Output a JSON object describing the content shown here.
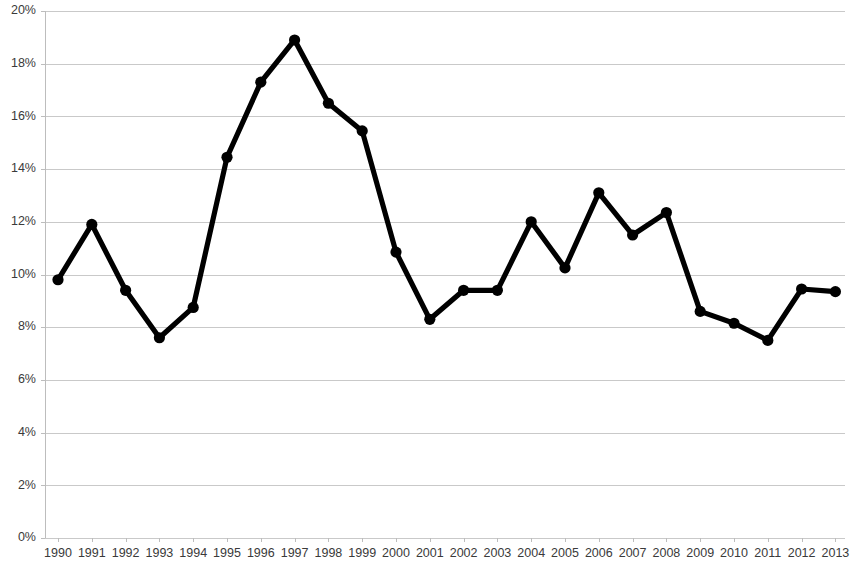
{
  "chart_data": {
    "type": "line",
    "title": "",
    "subtitle": "",
    "xlabel": "",
    "ylabel": "",
    "categories": [
      "1990",
      "1991",
      "1992",
      "1993",
      "1994",
      "1995",
      "1996",
      "1997",
      "1998",
      "1999",
      "2000",
      "2001",
      "2002",
      "2003",
      "2004",
      "2005",
      "2006",
      "2007",
      "2008",
      "2009",
      "2010",
      "2011",
      "2012",
      "2013"
    ],
    "values": [
      9.8,
      11.9,
      9.4,
      7.6,
      8.75,
      14.45,
      17.3,
      18.9,
      16.5,
      15.45,
      10.85,
      8.3,
      9.4,
      9.4,
      12.0,
      10.25,
      13.1,
      11.5,
      12.35,
      8.6,
      8.15,
      7.5,
      9.45,
      9.35
    ],
    "value_unit": "%",
    "series": [
      {
        "name": "",
        "values": [
          9.8,
          11.9,
          9.4,
          7.6,
          8.75,
          14.45,
          17.3,
          18.9,
          16.5,
          15.45,
          10.85,
          8.3,
          9.4,
          9.4,
          12.0,
          10.25,
          13.1,
          11.5,
          12.35,
          8.6,
          8.15,
          7.5,
          9.45,
          9.35
        ],
        "color": "#000000",
        "marker": "circle"
      }
    ],
    "ylim": [
      0,
      20
    ],
    "ytick_values": [
      0,
      2,
      4,
      6,
      8,
      10,
      12,
      14,
      16,
      18,
      20
    ],
    "ytick_labels": [
      "0%",
      "2%",
      "4%",
      "6%",
      "8%",
      "10%",
      "12%",
      "14%",
      "16%",
      "18%",
      "20%"
    ],
    "xtick_labels": [
      "1990",
      "1991",
      "1992",
      "1993",
      "1994",
      "1995",
      "1996",
      "1997",
      "1998",
      "1999",
      "2000",
      "2001",
      "2002",
      "2003",
      "2004",
      "2005",
      "2006",
      "2007",
      "2008",
      "2009",
      "2010",
      "2011",
      "2012",
      "2013"
    ],
    "grid": {
      "horizontal": true,
      "vertical": false,
      "color": "#c9c9c9"
    },
    "legend": {
      "visible": false,
      "position": "none",
      "entries": []
    },
    "annotations": [],
    "axis_colors": {
      "axis_line": "#bdbdbd",
      "tick_label": "#3a3a3a"
    },
    "background_color": "#ffffff"
  }
}
